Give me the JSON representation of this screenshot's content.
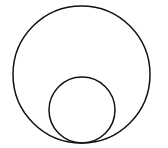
{
  "diagram": {
    "width": 168,
    "height": 148,
    "background": "#ffffff",
    "stroke_color": "#111111",
    "stroke_width": 1.5,
    "circles": [
      {
        "name": "outer-circle",
        "cx": 81.5,
        "cy": 74.5,
        "r": 68.5
      },
      {
        "name": "inner-circle",
        "cx": 82,
        "cy": 110,
        "r": 33
      }
    ],
    "tangent_point": {
      "x": 82,
      "y": 143
    }
  }
}
